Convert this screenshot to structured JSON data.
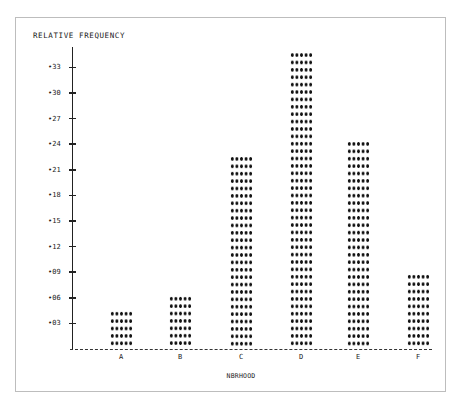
{
  "chart_data": {
    "type": "bar",
    "title": "",
    "xlabel": "NBRHOOD",
    "ylabel": "RELATIVE FREQUENCY",
    "categories": [
      "A",
      "B",
      "C",
      "D",
      "E",
      "F"
    ],
    "values": [
      0.04,
      0.06,
      0.225,
      0.35,
      0.24,
      0.09
    ],
    "y_ticks": [
      ".03",
      ".06",
      ".09",
      ".12",
      ".15",
      ".18",
      ".21",
      ".24",
      ".27",
      ".30",
      ".33"
    ],
    "ylim": [
      0,
      0.36
    ],
    "grid": false,
    "legend": null,
    "style": "dot-matrix printed bars (asterisk pattern)"
  },
  "colors": {
    "ink": "#111111",
    "frame": "#bdbdbd",
    "background": "#ffffff"
  }
}
